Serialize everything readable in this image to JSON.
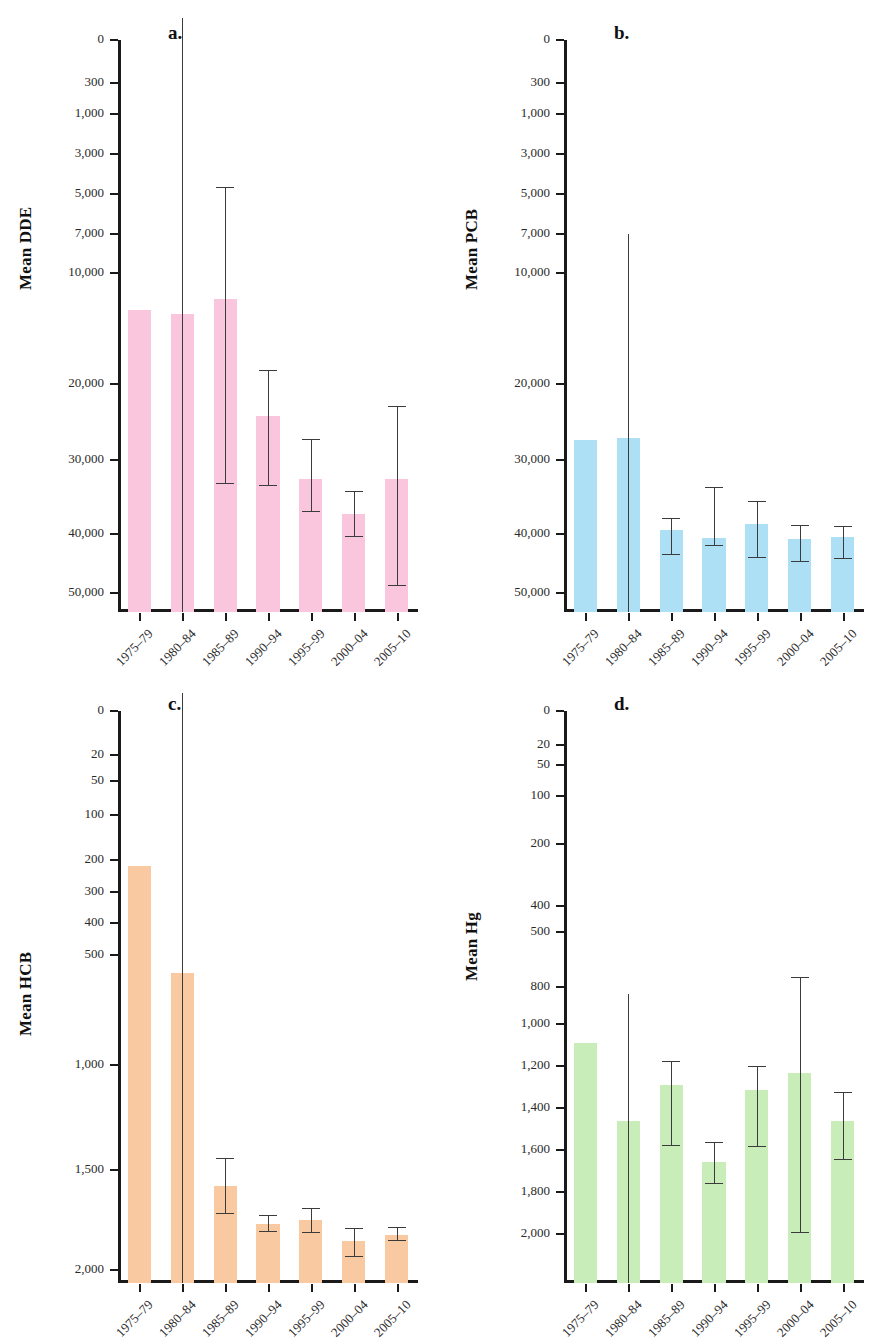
{
  "figure": {
    "panels": [
      {
        "letter": "a.",
        "ylabel": "Mean DDE",
        "color": "#f9c6de",
        "yticks": [
          0,
          300,
          1000,
          3000,
          5000,
          7000,
          10000,
          20000,
          30000,
          40000,
          50000
        ],
        "ytick_labels": [
          "0",
          "300",
          "1,000",
          "3,000",
          "5,000",
          "7,000",
          "10,000",
          "20,000",
          "30,000",
          "40,000",
          "50,000"
        ],
        "categories": [
          "1975–79",
          "1980–84",
          "1985–89",
          "1990–94",
          "1995–99",
          "2000–04",
          "2005–10"
        ],
        "values": [
          16200,
          15900,
          17200,
          7100,
          3950,
          2200,
          3950
        ],
        "err_low": [
          null,
          null,
          3700,
          3600,
          2300,
          1050,
          180
        ],
        "err_high": [
          null,
          57000,
          30500,
          10700,
          5900,
          3300,
          7800
        ]
      },
      {
        "letter": "b.",
        "ylabel": "Mean PCB",
        "color": "#aee0f5",
        "yticks": [
          0,
          300,
          1000,
          3000,
          5000,
          7000,
          10000,
          20000,
          30000,
          40000,
          50000
        ],
        "ytick_labels": [
          "0",
          "300",
          "1,000",
          "3,000",
          "5,000",
          "7,000",
          "10,000",
          "20,000",
          "30,000",
          "40,000",
          "50,000"
        ],
        "categories": [
          "1975–79",
          "1980–84",
          "1985–89",
          "1990–94",
          "1995–99",
          "2000–04",
          "2005–10"
        ],
        "values": [
          5900,
          6000,
          1400,
          1000,
          1700,
          970,
          1030
        ],
        "err_low": [
          null,
          null,
          620,
          820,
          540,
          450,
          520
        ],
        "err_high": [
          null,
          24500,
          1950,
          3500,
          2800,
          1600,
          1550
        ]
      },
      {
        "letter": "c.",
        "ylabel": "Mean HCB",
        "color": "#f9caa1",
        "yticks": [
          0,
          20,
          50,
          100,
          200,
          300,
          400,
          500,
          1000,
          1500,
          2000
        ],
        "ytick_labels": [
          "0",
          "20",
          "50",
          "100",
          "200",
          "300",
          "400",
          "500",
          "1,000",
          "1,500",
          "2,000"
        ],
        "categories": [
          "1975–79",
          "1980–84",
          "1985–89",
          "1990–94",
          "1995–99",
          "2000–04",
          "2005–10"
        ],
        "values": [
          1300,
          800,
          90,
          37,
          42,
          19,
          24
        ],
        "err_low": [
          null,
          null,
          48,
          28,
          27,
          12,
          19
        ],
        "err_high": [
          null,
          2150,
          145,
          46,
          55,
          31,
          32
        ]
      },
      {
        "letter": "d.",
        "ylabel": "Mean Hg",
        "color": "#c9edb8",
        "yticks": [
          0,
          20,
          50,
          100,
          200,
          400,
          500,
          800,
          1000,
          1200,
          1400,
          1600,
          1800,
          2000
        ],
        "ytick_labels": [
          "0",
          "20",
          "50",
          "100",
          "200",
          "400",
          "500",
          "800",
          "1,000",
          "1,200",
          "1,400",
          "1,600",
          "1,800",
          "2,000"
        ],
        "categories": [
          "1975–79",
          "1980–84",
          "1985–89",
          "1990–94",
          "1995–99",
          "2000–04",
          "2005–10"
        ],
        "values": [
          600,
          295,
          410,
          175,
          395,
          455,
          295
        ],
        "err_low": [
          null,
          null,
          215,
          130,
          210,
          45,
          180
        ],
        "err_high": [
          null,
          870,
          500,
          225,
          480,
          955,
          385
        ]
      }
    ]
  },
  "chart_data": [
    {
      "type": "bar",
      "title": "a.",
      "ylabel": "Mean DDE",
      "xlabel": "",
      "categories": [
        "1975–79",
        "1980–84",
        "1985–89",
        "1990–94",
        "1995–99",
        "2000–04",
        "2005–10"
      ],
      "values": [
        16200,
        15900,
        17200,
        7100,
        3950,
        2200,
        3950
      ],
      "error_low": [
        null,
        null,
        3700,
        3600,
        2300,
        1050,
        180
      ],
      "error_high": [
        null,
        57000,
        30500,
        10700,
        5900,
        3300,
        7800
      ],
      "ytick_values": [
        0,
        300,
        1000,
        3000,
        5000,
        7000,
        10000,
        20000,
        30000,
        40000,
        50000
      ],
      "ylim": [
        0,
        55000
      ],
      "grid": false,
      "legend": "none",
      "scale": "piecewise-nonlinear"
    },
    {
      "type": "bar",
      "title": "b.",
      "ylabel": "Mean PCB",
      "xlabel": "",
      "categories": [
        "1975–79",
        "1980–84",
        "1985–89",
        "1990–94",
        "1995–99",
        "2000–04",
        "2005–10"
      ],
      "values": [
        5900,
        6000,
        1400,
        1000,
        1700,
        970,
        1030
      ],
      "error_low": [
        null,
        null,
        620,
        820,
        540,
        450,
        520
      ],
      "error_high": [
        null,
        24500,
        1950,
        3500,
        2800,
        1600,
        1550
      ],
      "ytick_values": [
        0,
        300,
        1000,
        3000,
        5000,
        7000,
        10000,
        20000,
        30000,
        40000,
        50000
      ],
      "ylim": [
        0,
        55000
      ],
      "grid": false,
      "legend": "none",
      "scale": "piecewise-nonlinear"
    },
    {
      "type": "bar",
      "title": "c.",
      "ylabel": "Mean HCB",
      "xlabel": "",
      "categories": [
        "1975–79",
        "1980–84",
        "1985–89",
        "1990–94",
        "1995–99",
        "2000–04",
        "2005–10"
      ],
      "values": [
        1300,
        800,
        90,
        37,
        42,
        19,
        24
      ],
      "error_low": [
        null,
        null,
        48,
        28,
        27,
        12,
        19
      ],
      "error_high": [
        null,
        2150,
        145,
        46,
        55,
        31,
        32
      ],
      "ytick_values": [
        0,
        20,
        50,
        100,
        200,
        300,
        400,
        500,
        1000,
        1500,
        2000
      ],
      "ylim": [
        0,
        2180
      ],
      "grid": false,
      "legend": "none",
      "scale": "piecewise-nonlinear"
    },
    {
      "type": "bar",
      "title": "d.",
      "ylabel": "Mean Hg",
      "xlabel": "",
      "categories": [
        "1975–79",
        "1980–84",
        "1985–89",
        "1990–94",
        "1995–99",
        "2000–04",
        "2005–10"
      ],
      "values": [
        600,
        295,
        410,
        175,
        395,
        455,
        295
      ],
      "error_low": [
        null,
        null,
        215,
        130,
        210,
        45,
        180
      ],
      "error_high": [
        null,
        870,
        500,
        225,
        480,
        955,
        385
      ],
      "ytick_values": [
        0,
        20,
        50,
        100,
        200,
        400,
        500,
        800,
        1000,
        1200,
        1400,
        1600,
        1800,
        2000
      ],
      "ylim": [
        0,
        2000
      ],
      "grid": false,
      "legend": "none",
      "scale": "piecewise-nonlinear"
    }
  ]
}
